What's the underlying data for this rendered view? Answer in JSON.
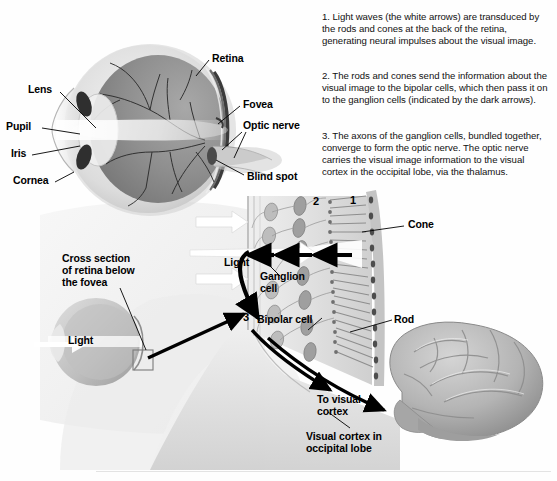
{
  "figure": {
    "background_color": "#fefefe",
    "width": 557,
    "height": 481
  },
  "explanation": {
    "steps": [
      {
        "number": "1",
        "text": "1. Light waves (the white arrows) are transduced by the rods and cones at the back of the retina, generating neural impulses about the visual image."
      },
      {
        "number": "2",
        "text": "2. The rods and cones send the information about the visual image to the bipolar cells, which then pass it on to the ganglion cells (indicated by the dark arrows)."
      },
      {
        "number": "3",
        "text": "3. The axons of the ganglion cells, bundled together, converge to form the optic nerve. The optic nerve carries the visual image information to the visual cortex in the occipital lobe, via the thalamus."
      }
    ]
  },
  "eye_labels": {
    "lens": "Lens",
    "pupil": "Pupil",
    "iris": "Iris",
    "cornea": "Cornea",
    "retina": "Retina",
    "fovea": "Fovea",
    "optic_nerve": "Optic nerve",
    "blind_spot": "Blind spot"
  },
  "retina_labels": {
    "cross_section": "Cross section\nof retina below\nthe fovea",
    "light_small_eye": "Light",
    "light_arrows": "Light",
    "ganglion_cell": "Ganglion\ncell",
    "bipolar_cell": "Bipolar cell",
    "cone": "Cone",
    "rod": "Rod",
    "layer_one": "1",
    "layer_two": "2",
    "layer_three": "3"
  },
  "brain_labels": {
    "to_visual_cortex": "To visual\ncortex",
    "visual_cortex_occipital": "Visual cortex in\noccipital lobe"
  },
  "colors": {
    "text": "#000000",
    "body_text": "#111111",
    "sclera": "#d8d8d8",
    "vitreous_dark": "#8c8c8c",
    "vitreous_light": "#c9c9c9",
    "retina_band": "#4a4a4a",
    "arrow_dark": "#000000",
    "arrow_light": "#ffffff",
    "brain": "#b8b8b8",
    "rule": "#e3e3e3"
  }
}
